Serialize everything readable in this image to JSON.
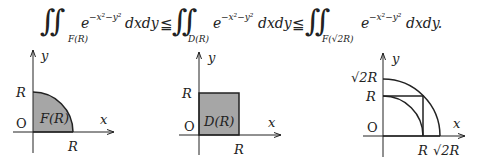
{
  "formula": {
    "terms": [
      {
        "integral": "∬",
        "region": "F(R)",
        "integrand": "e",
        "exponent": "−x²−y²",
        "differential": "dxdy"
      },
      {
        "integral": "∬",
        "region": "D(R)",
        "integrand": "e",
        "exponent": "−x²−y²",
        "differential": "dxdy"
      },
      {
        "integral": "∬",
        "region": "F(√2R)",
        "integrand": "e",
        "exponent": "−x²−y²",
        "differential": "dxdy."
      }
    ],
    "relations": [
      "≦",
      "≦"
    ]
  },
  "diagrams": [
    {
      "name": "quarter-disk",
      "region_label": "F(R)",
      "x_axis_label": "x",
      "y_axis_label": "y",
      "origin_label": "O",
      "x_tick": "R",
      "y_tick": "R",
      "fill": "#a6a6a6"
    },
    {
      "name": "square",
      "region_label": "D(R)",
      "x_axis_label": "x",
      "y_axis_label": "y",
      "origin_label": "O",
      "x_tick": "R",
      "y_tick": "R",
      "fill": "#a6a6a6"
    },
    {
      "name": "nested-regions",
      "x_axis_label": "x",
      "y_axis_label": "y",
      "origin_label": "O",
      "x_ticks": [
        "R",
        "√2R"
      ],
      "y_ticks": [
        "R",
        "√2R"
      ]
    }
  ]
}
